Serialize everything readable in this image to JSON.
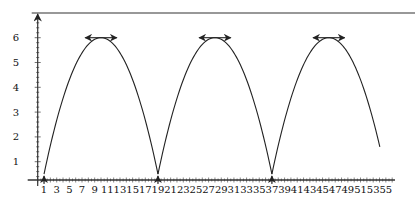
{
  "chart_data": {
    "type": "line",
    "title": "",
    "xlabel": "",
    "ylabel": "",
    "xlim": [
      0,
      56
    ],
    "ylim": [
      0,
      7
    ],
    "grid": false,
    "legend": null,
    "x_ticks": [
      1,
      3,
      5,
      7,
      9,
      11,
      13,
      15,
      17,
      19,
      21,
      23,
      25,
      27,
      29,
      31,
      33,
      35,
      37,
      39,
      41,
      43,
      45,
      47,
      49,
      51,
      53,
      55
    ],
    "y_ticks": [
      1,
      2,
      3,
      4,
      5,
      6
    ],
    "series": [
      {
        "name": "periodic arcs",
        "description": "Repeating inverted parabolic arcs, cusps near y≈0.5 at x=1, 19, 37; peaks y=6",
        "arcs": [
          {
            "start": 1,
            "end": 19,
            "peak_x": 10,
            "peak_y": 6,
            "cusp_y": 0.5
          },
          {
            "start": 19,
            "end": 37,
            "peak_x": 28,
            "peak_y": 6,
            "cusp_y": 0.5
          },
          {
            "start": 37,
            "end": 55,
            "peak_x": 46,
            "peak_y": 6,
            "cusp_y": 0.5,
            "end_y": 1.6
          }
        ]
      }
    ],
    "annotations": [
      {
        "type": "vertical-arrow-up",
        "x": 1,
        "from_y": 0,
        "to_y": 0.5
      },
      {
        "type": "vertical-arrow-up",
        "x": 19,
        "from_y": 0,
        "to_y": 0.5
      },
      {
        "type": "vertical-arrow-up",
        "x": 37,
        "from_y": 0,
        "to_y": 0.5
      },
      {
        "type": "horizontal-double-arrow",
        "x_from": 7.5,
        "x_to": 12.5,
        "y": 6
      },
      {
        "type": "horizontal-double-arrow",
        "x_from": 25.5,
        "x_to": 30.5,
        "y": 6
      },
      {
        "type": "horizontal-double-arrow",
        "x_from": 43.5,
        "x_to": 48.5,
        "y": 6
      },
      {
        "type": "top-boundary-line",
        "y": 7
      }
    ]
  },
  "layout": {
    "x0_px": 37.7,
    "px_per_x": 6.33,
    "y0_px": 186.5,
    "px_per_y": 24.8,
    "axis_y_px": 180,
    "top_line_y_px": 13
  },
  "colors": {
    "line": "#222222",
    "axis": "#333333",
    "text": "#111111"
  }
}
